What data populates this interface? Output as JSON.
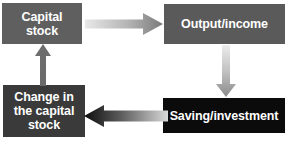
{
  "diagram": {
    "background_color": "#ffffff",
    "nodes": [
      {
        "id": "capital-stock",
        "label": "Capital\nstock",
        "fill": "#5f5f5f",
        "text_color": "#ffffff"
      },
      {
        "id": "output-income",
        "label": "Output/income",
        "fill": "#5a5a5a",
        "text_color": "#ffffff"
      },
      {
        "id": "change-capital-stock",
        "label": "Change in\nthe capital\nstock",
        "fill": "#3a3a3a",
        "text_color": "#ffffff"
      },
      {
        "id": "saving-investment",
        "label": "Saving/investment",
        "fill": "#0b0b0b",
        "text_color": "#ffffff"
      }
    ],
    "arrows": [
      {
        "id": "capital-stock-to-output-income",
        "direction": "right",
        "from": "capital-stock",
        "to": "output-income",
        "gradient_from": "#e2e2e2",
        "gradient_to": "#7d7d7d"
      },
      {
        "id": "output-income-to-saving-investment",
        "direction": "down",
        "from": "output-income",
        "to": "saving-investment",
        "gradient_from": "#e6e6e6",
        "gradient_to": "#8a8a8a"
      },
      {
        "id": "saving-investment-to-change-capital-stock",
        "direction": "left",
        "from": "saving-investment",
        "to": "change-capital-stock",
        "gradient_from": "#111111",
        "gradient_to": "#d8d8d8"
      },
      {
        "id": "change-capital-stock-to-capital-stock",
        "direction": "up",
        "from": "change-capital-stock",
        "to": "capital-stock",
        "gradient_from": "#6a6a6a",
        "gradient_to": "#6a6a6a"
      }
    ]
  }
}
